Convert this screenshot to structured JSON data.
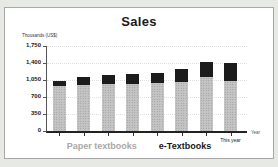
{
  "window": {
    "background": "#e7e9e5",
    "panel_background": "#ffffff",
    "panel_border": "#a8a8a8"
  },
  "chart_data": {
    "type": "bar",
    "stacked": true,
    "title": "Sales",
    "unit_label": "Thousands (US$)",
    "xlabel": "Year",
    "x_last_tick_label": "This year",
    "categories": [
      "",
      "",
      "",
      "",
      "",
      "",
      "",
      "This year"
    ],
    "series": [
      {
        "name": "Paper textbooks",
        "color": "#c4c4c4",
        "texture_dot_color": "#929292",
        "label_color": "#a8a8a8",
        "values": [
          925,
          950,
          970,
          975,
          980,
          1010,
          1110,
          1020
        ]
      },
      {
        "name": "e-Textbooks",
        "color": "#1c1c1c",
        "label_color": "#1a1a1a",
        "values": [
          110,
          160,
          180,
          190,
          220,
          260,
          320,
          390
        ]
      }
    ],
    "ylim": [
      0,
      1750
    ],
    "yticks": [
      {
        "value": 1750,
        "label": "1,750"
      },
      {
        "value": 1400,
        "label": "1,400"
      },
      {
        "value": 1050,
        "label": "1,050"
      },
      {
        "value": 700,
        "label": "700"
      },
      {
        "value": 350,
        "label": "350"
      },
      {
        "value": 0,
        "label": "0"
      }
    ],
    "grid": true,
    "legend_position": "bottom"
  }
}
